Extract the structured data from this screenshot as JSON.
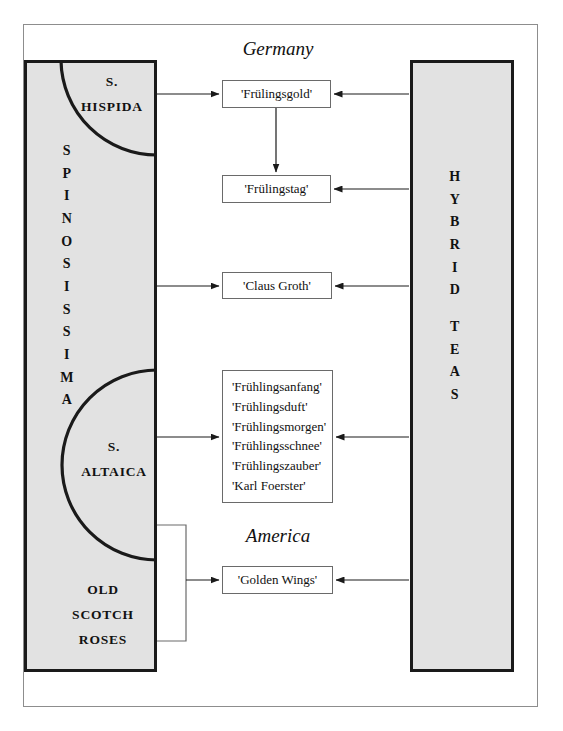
{
  "diagram": {
    "left_block": {
      "name": "spinosissima-block",
      "vertical_label": "SPINOSISSIMA",
      "letters": [
        "S",
        "P",
        "I",
        "N",
        "O",
        "S",
        "I",
        "S",
        "S",
        "I",
        "M",
        "A"
      ],
      "sections": [
        {
          "name": "hispida",
          "line1": "S.",
          "line2": "HISPIDA"
        },
        {
          "name": "altaica",
          "line1": "S.",
          "line2": "ALTAICA"
        },
        {
          "name": "old-scotch-roses",
          "line1": "OLD",
          "line2": "SCOTCH",
          "line3": "ROSES"
        }
      ]
    },
    "right_block": {
      "name": "hybrid-teas-block",
      "vertical_label": "HYBRID TEAS",
      "letters_top": [
        "H",
        "Y",
        "B",
        "R",
        "I",
        "D"
      ],
      "letters_bottom": [
        "T",
        "E",
        "A",
        "S"
      ]
    },
    "regions": [
      {
        "name": "germany",
        "label": "Germany"
      },
      {
        "name": "america",
        "label": "America"
      }
    ],
    "cultivars": [
      {
        "name": "fruelingsgold",
        "label": "'Frülingsgold'"
      },
      {
        "name": "fruelingstag",
        "label": "'Frülingstag'"
      },
      {
        "name": "claus-groth",
        "label": "'Claus Groth'"
      },
      {
        "name": "golden-wings",
        "label": "'Golden Wings'"
      }
    ],
    "cultivar_group": {
      "name": "fruehlings-group",
      "entries": [
        "'Frühlingsanfang'",
        "'Frühlingsduft'",
        "'Frühlingsmorgen'",
        "'Frühlingsschnee'",
        "'Frühlingszauber'",
        "'Karl Foerster'"
      ]
    },
    "colors": {
      "block_fill": "#e2e2e2",
      "block_border": "#1a1a1a",
      "box_border": "#6a6a6a",
      "arrow": "#1a1a1a",
      "frame": "#8d8d8d",
      "text": "#111111"
    }
  }
}
